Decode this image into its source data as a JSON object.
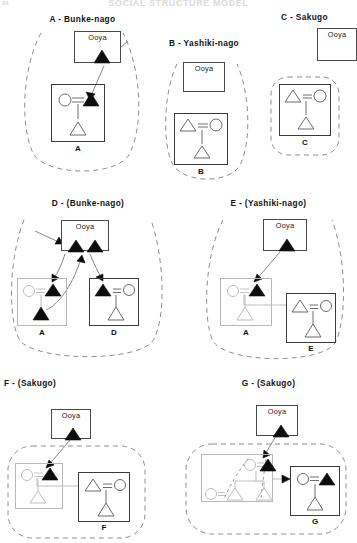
{
  "figure": {
    "title": "SOCIAL STRUCTURE MODEL",
    "page_number": "24"
  },
  "legend_terms": {
    "ooya": "Ooya",
    "bunke_nago": "Bunke-nago",
    "yashiki_nago": "Yashiki-nago",
    "sakugo": "Sakugo"
  },
  "panels": [
    {
      "id": "A",
      "title": "A - Bunke-nago",
      "ooya_label": "Ooya",
      "ooya_members": [
        "filled-triangle"
      ],
      "households": [
        {
          "label": "A",
          "emphasis": "bold",
          "members": [
            "circle",
            "filled-triangle",
            "open-triangle"
          ]
        }
      ],
      "enclosure": "tall-dashed-loop",
      "arrows": 1
    },
    {
      "id": "B",
      "title": "B - Yashiki-nago",
      "ooya_label": "Ooya",
      "ooya_members": [],
      "households": [
        {
          "label": "B",
          "emphasis": "bold",
          "members": [
            "open-triangle",
            "circle",
            "open-triangle"
          ]
        }
      ],
      "enclosure": "tall-dashed-loop",
      "arrows": 0
    },
    {
      "id": "C",
      "title": "C - Sakugo",
      "ooya_label": "Ooya",
      "ooya_members": [],
      "households": [
        {
          "label": "C",
          "emphasis": "bold",
          "members": [
            "open-triangle",
            "circle",
            "open-triangle"
          ]
        }
      ],
      "enclosure": "rounded-dashed-box",
      "arrows": 0
    },
    {
      "id": "D",
      "title": "D - (Bunke-nago)",
      "ooya_label": "Ooya",
      "ooya_members": [
        "filled-triangle",
        "filled-triangle"
      ],
      "households": [
        {
          "label": "A",
          "emphasis": "faint",
          "members": [
            "circle",
            "filled-triangle",
            "filled-triangle"
          ]
        },
        {
          "label": "D",
          "emphasis": "bold",
          "members": [
            "filled-triangle",
            "circle",
            "open-triangle"
          ]
        }
      ],
      "enclosure": "wide-dashed-loop",
      "arrows": 3
    },
    {
      "id": "E",
      "title": "E - (Yashiki-nago)",
      "ooya_label": "Ooya",
      "ooya_members": [
        "filled-triangle"
      ],
      "households": [
        {
          "label": "A",
          "emphasis": "faint",
          "members": [
            "circle",
            "filled-triangle",
            "open-triangle"
          ]
        },
        {
          "label": "E",
          "emphasis": "bold",
          "members": [
            "open-triangle",
            "circle",
            "open-triangle"
          ]
        }
      ],
      "enclosure": "wide-dashed-loop",
      "arrows": 1
    },
    {
      "id": "F",
      "title": "F - (Sakugo)",
      "ooya_label": "Ooya",
      "ooya_members": [
        "filled-triangle"
      ],
      "households": [
        {
          "label": "A",
          "emphasis": "faint",
          "members": [
            "circle",
            "filled-triangle",
            "open-triangle"
          ]
        },
        {
          "label": "F",
          "emphasis": "bold",
          "members": [
            "open-triangle",
            "circle",
            "open-triangle"
          ]
        }
      ],
      "enclosure": "rounded-dashed-box",
      "arrows": 1
    },
    {
      "id": "G",
      "title": "G - (Sakugo)",
      "ooya_label": "Ooya",
      "ooya_members": [
        "filled-triangle"
      ],
      "households": [
        {
          "label": "",
          "emphasis": "faint",
          "members": [
            "circle",
            "filled-triangle",
            "circle",
            "open-triangle",
            "open-triangle"
          ],
          "inner_enclosure": "dashed-sub-group"
        },
        {
          "label": "G",
          "emphasis": "bold",
          "members": [
            "circle",
            "filled-triangle",
            "open-triangle"
          ]
        }
      ],
      "enclosure": "rounded-dashed-box",
      "arrows": 2
    }
  ],
  "symbols": {
    "filled_triangle": "male-ego-marked",
    "open_triangle": "male",
    "circle": "female",
    "equals": "marriage-tie",
    "vertical": "descent-tie",
    "arrow": "derivation-arrow"
  }
}
